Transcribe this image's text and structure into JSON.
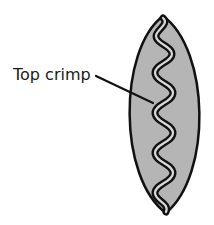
{
  "diagram": {
    "label": "Top crimp",
    "colors": {
      "background": "#ffffff",
      "fill": "#b5b5b5",
      "outline": "#111111",
      "crimp_inner": "#e6e6e6",
      "text": "#1a1a1a"
    }
  }
}
